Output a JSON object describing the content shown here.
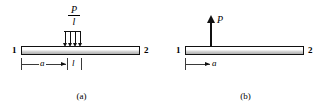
{
  "figure": {
    "type": "engineering-beam-loading-diagram",
    "background_color": "#ffffff",
    "line_color": "#111111",
    "dimension_color": "#3a3a3a",
    "beam_fill_color": "#c9c9c9"
  },
  "panels": [
    {
      "id": "a",
      "caption": "(a)",
      "beam": {
        "left_node_label": "1",
        "right_node_label": "2"
      },
      "load": {
        "kind": "distributed",
        "label_numerator": "P",
        "label_denominator": "l",
        "arrow_count": 4,
        "direction": "down"
      },
      "dimensions": [
        {
          "label": "a",
          "arrow": "right"
        },
        {
          "label": "l",
          "arrow": "none"
        }
      ]
    },
    {
      "id": "b",
      "caption": "(b)",
      "beam": {
        "left_node_label": "1",
        "right_node_label": "2"
      },
      "load": {
        "kind": "point",
        "label": "P",
        "direction": "up"
      },
      "dimensions": [
        {
          "label": "a",
          "arrow": "right"
        }
      ]
    }
  ]
}
